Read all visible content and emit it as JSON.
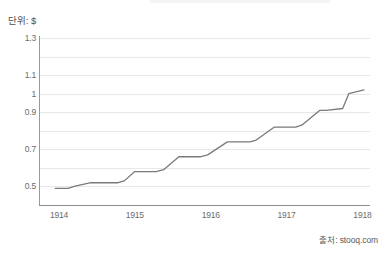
{
  "unit_label": "단위: $",
  "source_label": "출처: stooq.com",
  "colors": {
    "line": "#7a7a7a",
    "grid": "#e8e8ea",
    "axis": "#8e8e8e",
    "text": "#6b6b6b",
    "background": "#ffffff"
  },
  "chart_data": {
    "type": "line",
    "title": "",
    "subtitle": "",
    "xlabel": "",
    "ylabel": "단위: $",
    "xlim": [
      1913.75,
      1918.1
    ],
    "ylim": [
      0.4,
      1.3
    ],
    "grid": true,
    "legend": false,
    "legend_position": "none",
    "y_tick_values": [
      0.5,
      0.6,
      0.7,
      0.8,
      0.9,
      1.0,
      1.1,
      1.2,
      1.3
    ],
    "y_tick_labels": [
      "0.5",
      "",
      "0.7",
      "",
      "0.9",
      "1",
      "1.1",
      "",
      "1.3"
    ],
    "x_tick_values": [
      1914,
      1915,
      1916,
      1917,
      1918
    ],
    "x_tick_labels": [
      "1914",
      "1915",
      "1916",
      "1917",
      "1918"
    ],
    "series": [
      {
        "name": "가격",
        "x": [
          1913.95,
          1914.12,
          1914.2,
          1914.42,
          1914.52,
          1914.78,
          1914.86,
          1915.0,
          1915.1,
          1915.28,
          1915.38,
          1915.58,
          1915.66,
          1915.86,
          1915.96,
          1916.22,
          1916.3,
          1916.52,
          1916.6,
          1916.84,
          1916.92,
          1917.12,
          1917.2,
          1917.44,
          1917.52,
          1917.74,
          1917.82,
          1918.02
        ],
        "y": [
          0.49,
          0.49,
          0.5,
          0.52,
          0.52,
          0.52,
          0.53,
          0.58,
          0.58,
          0.58,
          0.59,
          0.66,
          0.66,
          0.66,
          0.67,
          0.74,
          0.74,
          0.74,
          0.75,
          0.82,
          0.82,
          0.82,
          0.83,
          0.91,
          0.91,
          0.92,
          1.0,
          1.02
        ]
      }
    ],
    "annotations": []
  }
}
